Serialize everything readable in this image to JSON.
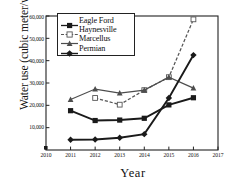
{
  "chart_data": {
    "type": "line",
    "title": "",
    "xlabel": "Year",
    "ylabel": "Water use (cubic meter/well)",
    "xlim": [
      2010,
      2017
    ],
    "ylim": [
      0,
      60000
    ],
    "xticks": [
      2010,
      2011,
      2012,
      2013,
      2014,
      2015,
      2016,
      2017
    ],
    "xticklabels": [
      "2010",
      "2011",
      "2012",
      "2013",
      "2014",
      "2015",
      "2016",
      "2017"
    ],
    "yticks": [
      10000,
      20000,
      30000,
      40000,
      50000,
      60000
    ],
    "yticklabels": [
      "10,000",
      "20,000",
      "30,000",
      "40,000",
      "50,000",
      "60,000"
    ],
    "grid": false,
    "legend_position": "upper left",
    "series": [
      {
        "name": "Eagle Ford",
        "marker": "filled-square",
        "linestyle": "solid",
        "color": "#1a1a1a",
        "x": [
          2011,
          2012,
          2013,
          2014,
          2015,
          2016
        ],
        "values": [
          17600,
          13200,
          13400,
          14200,
          20200,
          23400
        ]
      },
      {
        "name": "Haynesville",
        "marker": "open-square",
        "linestyle": "dashed",
        "color": "#555555",
        "x": [
          2012,
          2013,
          2014,
          2015,
          2016
        ],
        "values": [
          23300,
          20300,
          26800,
          32600,
          58500
        ]
      },
      {
        "name": "Marcellus",
        "marker": "filled-triangle",
        "linestyle": "solid",
        "color": "#4d4d4d",
        "x": [
          2011,
          2012,
          2013,
          2014,
          2015,
          2016
        ],
        "values": [
          22600,
          27300,
          25500,
          26800,
          32600,
          27700
        ]
      },
      {
        "name": "Permian",
        "marker": "filled-diamond",
        "linestyle": "solid",
        "color": "#1a1a1a",
        "x": [
          2011,
          2012,
          2013,
          2014,
          2015,
          2016
        ],
        "values": [
          4600,
          4700,
          5500,
          7100,
          23300,
          42500
        ]
      }
    ]
  },
  "axes": {
    "frame_color": "#222222"
  }
}
